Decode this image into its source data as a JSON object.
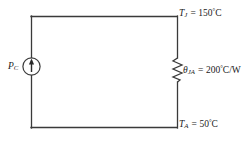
{
  "figure": {
    "type": "thermal-equivalent-circuit-diagram",
    "background_color": "#ffffff",
    "line_color": "#3a3a3a",
    "text_color": "#1a1a1a",
    "width": 247,
    "height": 147
  },
  "source": {
    "name": "current-source",
    "symbol": "circle-with-up-arrow",
    "label_var": "P",
    "label_sub": "C",
    "arrow_direction": "up"
  },
  "resistor": {
    "name": "thermal-resistance",
    "symbol": "zigzag",
    "label_var": "θ",
    "label_sub": "JA",
    "equals": "=",
    "value": "200",
    "degree": "°",
    "unit": "C/W",
    "value_full": "200°C/W"
  },
  "node_top": {
    "name": "junction-temperature",
    "label_var": "T",
    "label_sub": "J",
    "equals": "=",
    "value": "150",
    "degree": "°",
    "unit": "C",
    "value_full": "150°C"
  },
  "node_bottom": {
    "name": "ambient-temperature",
    "label_var": "T",
    "label_sub": "A",
    "equals": "=",
    "value": "50",
    "degree": "°",
    "unit": "C",
    "value_full": "50°C"
  }
}
